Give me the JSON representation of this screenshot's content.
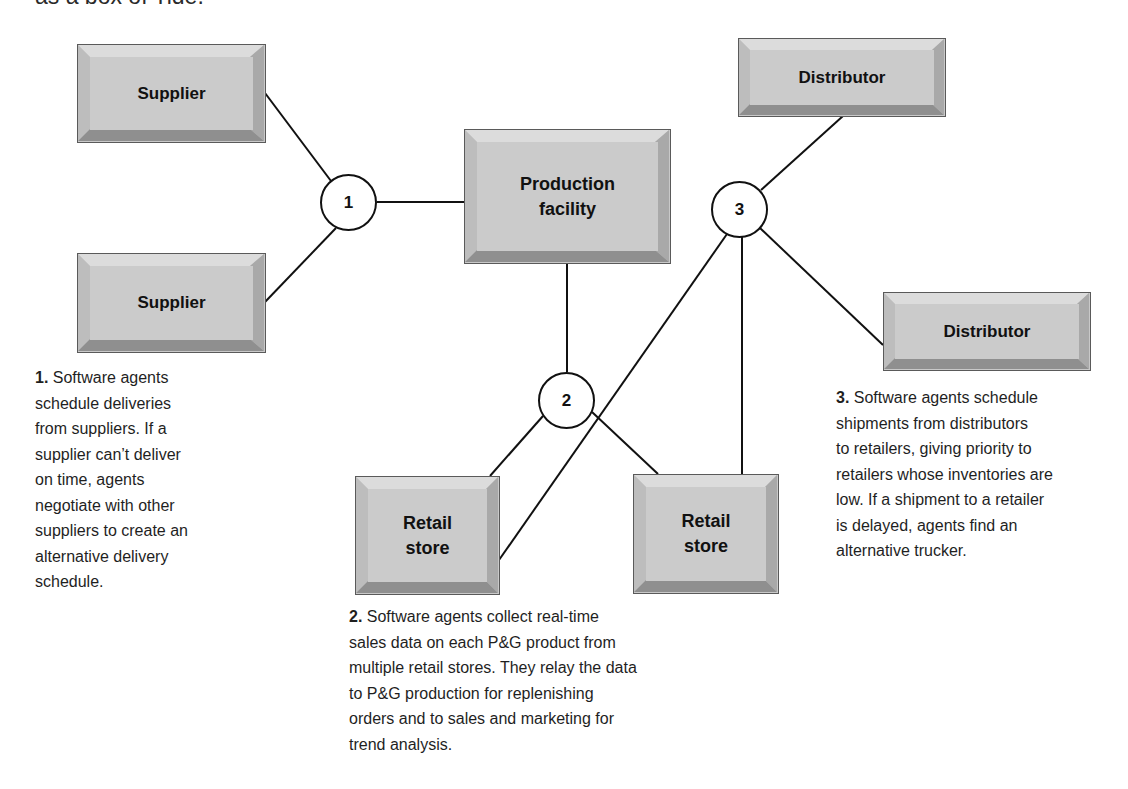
{
  "cut_off_text": "as a box of Tide.",
  "nodes": {
    "supplier_top": {
      "label": "Supplier"
    },
    "supplier_bottom": {
      "label": "Supplier"
    },
    "production": {
      "label_line1": "Production",
      "label_line2": "facility"
    },
    "distributor_top": {
      "label": "Distributor"
    },
    "distributor_right": {
      "label": "Distributor"
    },
    "retail_left": {
      "label_line1": "Retail",
      "label_line2": "store"
    },
    "retail_right": {
      "label_line1": "Retail",
      "label_line2": "store"
    }
  },
  "circles": {
    "c1": "1",
    "c2": "2",
    "c3": "3"
  },
  "descriptions": {
    "d1": {
      "num": "1.",
      "lines": [
        " Software agents",
        "schedule deliveries",
        "from suppliers. If a",
        "supplier can’t deliver",
        "on time, agents",
        "negotiate with other",
        "suppliers to create an",
        "alternative delivery",
        "schedule."
      ]
    },
    "d2": {
      "num": "2.",
      "lines": [
        " Software agents collect real-time",
        "sales data on each P&G product from",
        "multiple retail stores. They relay the data",
        "to P&G production for replenishing",
        "orders and to sales and marketing for",
        "trend analysis."
      ]
    },
    "d3": {
      "num": "3.",
      "lines": [
        " Software agents schedule",
        "shipments from distributors",
        "to retailers, giving priority to",
        "retailers whose inventories are",
        "low. If a shipment to a retailer",
        "is delayed, agents find an",
        "alternative trucker."
      ]
    }
  },
  "colors": {
    "line": "#111111",
    "box_face": "#cbcbcb",
    "box_top_bevel": "#dcdcdc",
    "box_left_bevel": "#bdbdbd",
    "box_right_bevel": "#a9a9a9",
    "box_bottom_bevel": "#8f8f8f",
    "box_outline": "#5a5a5a"
  }
}
